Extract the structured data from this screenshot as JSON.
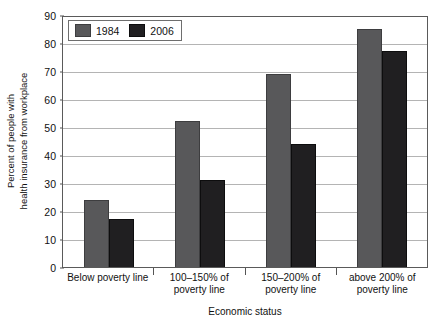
{
  "chart_data": {
    "type": "bar",
    "title": "",
    "xlabel": "Economic status",
    "ylabel": "Percent of people with health insurance from workplace",
    "ylabel_lines": [
      "Percent of people with",
      "health insurance from workplace"
    ],
    "categories": [
      "Below poverty line",
      "100–150% of poverty line",
      "150–200% of poverty line",
      "above 200% of poverty line"
    ],
    "category_lines": [
      [
        "Below poverty line"
      ],
      [
        "100–150% of",
        "poverty line"
      ],
      [
        "150–200% of",
        "poverty line"
      ],
      [
        "above 200% of",
        "poverty line"
      ]
    ],
    "series": [
      {
        "name": "1984",
        "color": "#58585a",
        "values": [
          24,
          52,
          69,
          85
        ]
      },
      {
        "name": "2006",
        "color": "#201f21",
        "values": [
          17,
          31,
          44,
          77
        ]
      }
    ],
    "ylim": [
      0,
      90
    ],
    "yticks": [
      0,
      10,
      20,
      30,
      40,
      50,
      60,
      70,
      80,
      90
    ],
    "ytick_labels": [
      "0",
      "10",
      "20",
      "30",
      "40",
      "50",
      "60",
      "70",
      "80",
      "90"
    ],
    "grid": true,
    "legend_position": "top-left",
    "legend": [
      "1984",
      "2006"
    ]
  }
}
